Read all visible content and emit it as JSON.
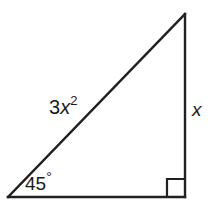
{
  "figure": {
    "name": "right-triangle-45-degree",
    "background_color": "#ffffff",
    "stroke_color": "#231f20",
    "stroke_width": 2.4,
    "text_color": "#1a1a1a"
  },
  "geometry": {
    "vertices": {
      "apex": {
        "x": 185,
        "y": 14
      },
      "bottom_left": {
        "x": 8,
        "y": 197
      },
      "bottom_right": {
        "x": 185,
        "y": 197
      }
    },
    "right_angle_marker": {
      "x": 167,
      "y": 179,
      "size": 18
    }
  },
  "labels": {
    "hypotenuse": {
      "coefficient": "3",
      "variable": "x",
      "exponent": "2",
      "full_text": "3x²"
    },
    "vertical_leg": {
      "text": "x"
    },
    "angle": {
      "value": "45",
      "degree_symbol": "°",
      "full_text": "45°"
    }
  }
}
